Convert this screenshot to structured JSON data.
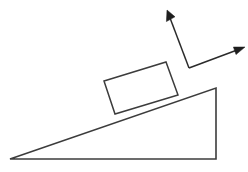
{
  "figure": {
    "background_color": "#ffffff",
    "stroke_color": "#3c3c3c",
    "vector_color": "#1e1e1e",
    "width": 248,
    "height": 172
  },
  "incline": {
    "name": "inclined-plane-ramp",
    "shape": "right-triangle",
    "points": "10,159 216,88 216,159",
    "vertices": {
      "left_toe": [
        10,
        159
      ],
      "apex_top": [
        216,
        88
      ],
      "bottom_right": [
        216,
        159
      ]
    },
    "angle_degrees": 19
  },
  "block": {
    "name": "sliding-block",
    "shape": "rotated-rectangle",
    "points": "104,81 166,62 178,95 115,114",
    "vertices": {
      "top_left": [
        104,
        81
      ],
      "top_right": [
        166,
        62
      ],
      "bottom_right": [
        178,
        95
      ],
      "bottom_left": [
        115,
        114
      ]
    }
  },
  "vectors": {
    "origin": [
      189,
      68
    ],
    "items": [
      {
        "name": "normal-force-vector",
        "label": "",
        "from": [
          189,
          68
        ],
        "to": [
          167,
          10
        ],
        "head_points": "167,10 166.4,21.6 175.0,16.8",
        "direction": "up-left"
      },
      {
        "name": "applied-force-vector",
        "label": "",
        "from": [
          189,
          68
        ],
        "to": [
          245,
          47
        ],
        "head_points": "245,47 233.4,47.0 236.0,54.6",
        "direction": "right-up"
      }
    ]
  }
}
